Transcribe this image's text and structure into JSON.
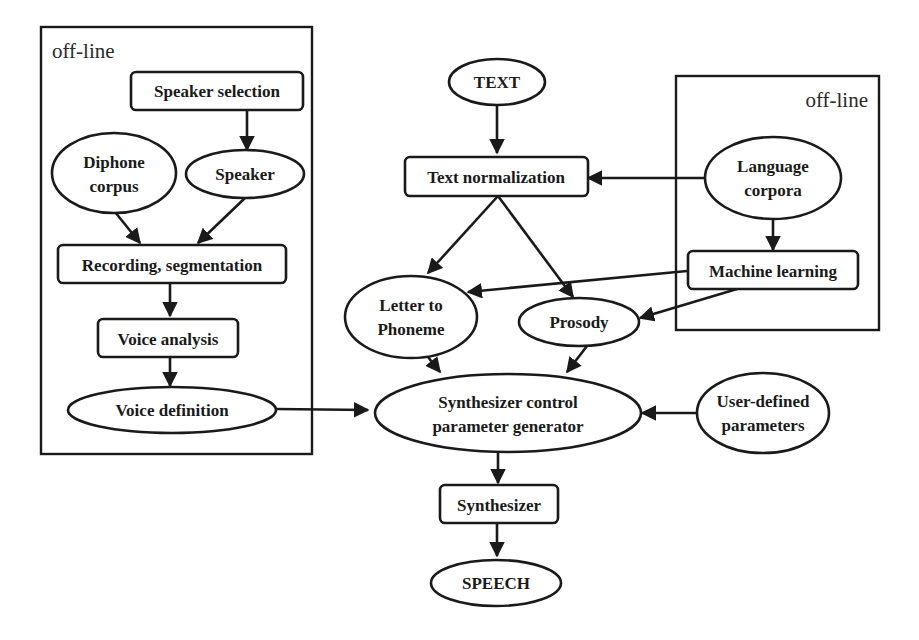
{
  "groups": [
    {
      "id": "left-offline",
      "label": "off-line"
    },
    {
      "id": "right-offline",
      "label": "off-line"
    }
  ],
  "nodes": {
    "speaker_selection": {
      "shape": "box",
      "lines": [
        "Speaker selection"
      ]
    },
    "diphone_corpus": {
      "shape": "ellipse",
      "lines": [
        "Diphone",
        "corpus"
      ]
    },
    "speaker": {
      "shape": "ellipse",
      "lines": [
        "Speaker"
      ]
    },
    "recording": {
      "shape": "box",
      "lines": [
        "Recording, segmentation"
      ]
    },
    "voice_analysis": {
      "shape": "box",
      "lines": [
        "Voice analysis"
      ]
    },
    "voice_definition": {
      "shape": "ellipse",
      "lines": [
        "Voice definition"
      ]
    },
    "text": {
      "shape": "ellipse",
      "lines": [
        "TEXT"
      ]
    },
    "text_normalization": {
      "shape": "box",
      "lines": [
        "Text normalization"
      ]
    },
    "language_corpora": {
      "shape": "ellipse",
      "lines": [
        "Language",
        "corpora"
      ]
    },
    "machine_learning": {
      "shape": "box",
      "lines": [
        "Machine learning"
      ]
    },
    "letter_to_phoneme": {
      "shape": "ellipse",
      "lines": [
        "Letter to",
        "Phoneme"
      ]
    },
    "prosody": {
      "shape": "ellipse",
      "lines": [
        "Prosody"
      ]
    },
    "synth_control": {
      "shape": "ellipse",
      "lines": [
        "Synthesizer control",
        "parameter generator"
      ]
    },
    "user_params": {
      "shape": "ellipse",
      "lines": [
        "User-defined",
        "parameters"
      ]
    },
    "synthesizer": {
      "shape": "box",
      "lines": [
        "Synthesizer"
      ]
    },
    "speech": {
      "shape": "ellipse",
      "lines": [
        "SPEECH"
      ]
    }
  },
  "edges": [
    [
      "speaker_selection",
      "speaker"
    ],
    [
      "diphone_corpus",
      "recording"
    ],
    [
      "speaker",
      "recording"
    ],
    [
      "recording",
      "voice_analysis"
    ],
    [
      "voice_analysis",
      "voice_definition"
    ],
    [
      "voice_definition",
      "synth_control"
    ],
    [
      "text",
      "text_normalization"
    ],
    [
      "language_corpora",
      "text_normalization"
    ],
    [
      "language_corpora",
      "machine_learning"
    ],
    [
      "text_normalization",
      "letter_to_phoneme"
    ],
    [
      "text_normalization",
      "prosody"
    ],
    [
      "machine_learning",
      "letter_to_phoneme"
    ],
    [
      "machine_learning",
      "prosody"
    ],
    [
      "letter_to_phoneme",
      "synth_control"
    ],
    [
      "prosody",
      "synth_control"
    ],
    [
      "user_params",
      "synth_control"
    ],
    [
      "synth_control",
      "synthesizer"
    ],
    [
      "synthesizer",
      "speech"
    ]
  ]
}
